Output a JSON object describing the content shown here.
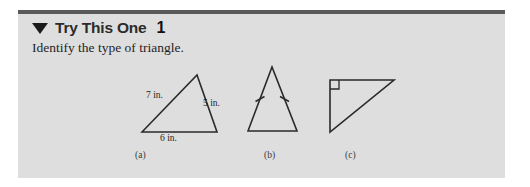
{
  "panel": {
    "background_color": "#dedede",
    "top_rule_color": "#5a5a5a"
  },
  "header": {
    "bullet_icon": "triangle-down-icon",
    "title": "Try This One",
    "number": "1"
  },
  "prompt": {
    "text": "Identify the type of triangle."
  },
  "figures": [
    {
      "caption": "(a)",
      "kind": "scalene-triangle",
      "labels": {
        "left_side": "7 in.",
        "right_side": "5 in.",
        "base": "6 in."
      }
    },
    {
      "caption": "(b)",
      "kind": "isosceles-triangle",
      "marks": "congruence-tick-marks"
    },
    {
      "caption": "(c)",
      "kind": "right-triangle",
      "marks": "right-angle-square"
    }
  ],
  "stroke_color": "#2a2a2a"
}
